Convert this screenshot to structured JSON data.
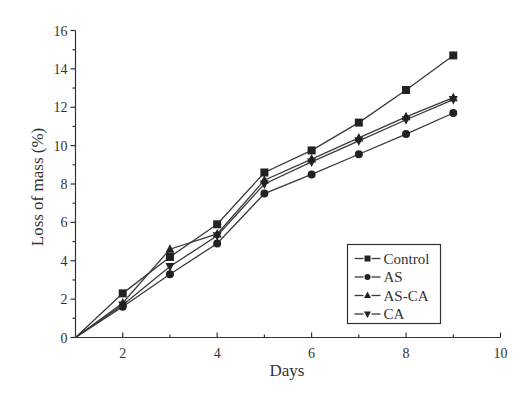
{
  "chart_data": {
    "type": "line",
    "title": "",
    "xlabel": "Days",
    "ylabel": "Loss of mass (%)",
    "xlim": [
      1,
      10
    ],
    "ylim": [
      0,
      16
    ],
    "x_ticks": [
      2,
      4,
      6,
      8,
      10
    ],
    "x_minor_ticks": [
      3,
      5,
      7,
      9
    ],
    "y_ticks": [
      0,
      2,
      4,
      6,
      8,
      10,
      12,
      14,
      16
    ],
    "y_minor_ticks": [
      1,
      3,
      5,
      7,
      9,
      11,
      13,
      15
    ],
    "grid": false,
    "legend_position": "lower right (inside plot)",
    "x": [
      1,
      2,
      3,
      4,
      5,
      6,
      7,
      8,
      9
    ],
    "series": [
      {
        "name": "Control",
        "marker": "square",
        "values": [
          0,
          2.3,
          4.2,
          5.9,
          8.6,
          9.75,
          11.2,
          12.9,
          14.7
        ]
      },
      {
        "name": "AS",
        "marker": "circle",
        "values": [
          0,
          1.6,
          3.3,
          4.9,
          7.5,
          8.5,
          9.55,
          10.6,
          11.7
        ]
      },
      {
        "name": "AS-CA",
        "marker": "triangle-up",
        "values": [
          0,
          1.8,
          4.6,
          5.4,
          8.2,
          9.3,
          10.4,
          11.5,
          12.5
        ]
      },
      {
        "name": "CA",
        "marker": "triangle-down",
        "values": [
          0,
          1.7,
          3.7,
          5.3,
          8.0,
          9.15,
          10.25,
          11.35,
          12.4
        ]
      }
    ]
  },
  "legend": {
    "items": [
      "Control",
      "AS",
      "AS-CA",
      "CA"
    ]
  },
  "colors": {
    "line": "#3a3a3a",
    "marker": "#222222",
    "axis": "#333333",
    "background": "#ffffff"
  }
}
